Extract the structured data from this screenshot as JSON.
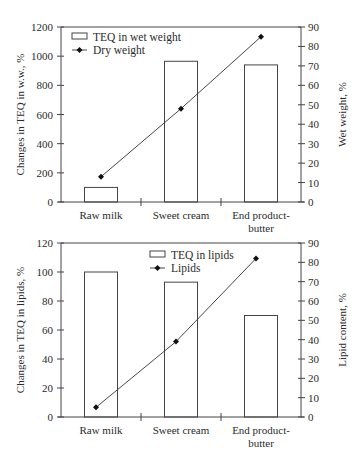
{
  "chart_data": [
    {
      "type": "bar",
      "title": "",
      "categories": [
        "Raw milk",
        "Sweet cream",
        "End product-butter"
      ],
      "category_lines": [
        [
          "Raw milk"
        ],
        [
          "Sweet cream"
        ],
        [
          "End product-",
          "butter"
        ]
      ],
      "ylabel": "Changes in TEQ in w.w., %",
      "y2label": "Wet weight, %",
      "ylim": [
        0,
        1200
      ],
      "y2lim": [
        0,
        90
      ],
      "yticks": [
        0,
        200,
        400,
        600,
        800,
        1000,
        1200
      ],
      "y2ticks": [
        0,
        10,
        20,
        30,
        40,
        50,
        60,
        70,
        80,
        90
      ],
      "legend_position": "upper-left",
      "grid": false,
      "series": [
        {
          "name": "TEQ in wet weight",
          "type": "bar",
          "axis": "left",
          "values": [
            100,
            965,
            940
          ]
        },
        {
          "name": "Dry weight",
          "type": "line",
          "axis": "right",
          "marker": "diamond",
          "values": [
            13,
            48,
            85
          ]
        }
      ]
    },
    {
      "type": "bar",
      "title": "",
      "categories": [
        "Raw milk",
        "Sweet cream",
        "End product-butter"
      ],
      "category_lines": [
        [
          "Raw milk"
        ],
        [
          "Sweet cream"
        ],
        [
          "End product-",
          "butter"
        ]
      ],
      "ylabel": "Changes in TEQ in lipids, %",
      "y2label": "Lipid content, %",
      "ylim": [
        0,
        120
      ],
      "y2lim": [
        0,
        90
      ],
      "yticks": [
        0,
        20,
        40,
        60,
        80,
        100,
        120
      ],
      "y2ticks": [
        0,
        10,
        20,
        30,
        40,
        50,
        60,
        70,
        80,
        90
      ],
      "legend_position": "upper-center",
      "grid": false,
      "series": [
        {
          "name": "TEQ in lipids",
          "type": "bar",
          "axis": "left",
          "values": [
            100,
            93,
            70
          ]
        },
        {
          "name": "Lipids",
          "type": "line",
          "axis": "right",
          "marker": "diamond",
          "values": [
            5,
            39,
            82
          ]
        }
      ]
    }
  ]
}
